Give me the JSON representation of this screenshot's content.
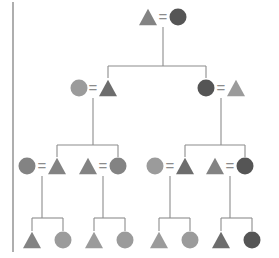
{
  "figure": {
    "kind": "pedigree-chart",
    "width": 279,
    "height": 258,
    "background": "#ffffff",
    "left_border": {
      "x": 13,
      "y_top": 2,
      "y_bottom": 252,
      "color": "#9a9a9a",
      "width": 1.6
    },
    "line_color": "#8c8c8c",
    "line_width": 1.1,
    "mating_symbol": "=",
    "mating_symbol_color": "#8c8c8c",
    "palette": {
      "light_gray": "#9b9b9b",
      "mid_gray": "#838383",
      "dark_gray": "#6d6d6d",
      "darkest_gray": "#555555"
    },
    "generations": [
      {
        "label": "I",
        "y": 17
      },
      {
        "label": "II",
        "y": 88
      },
      {
        "label": "III",
        "y": 166
      },
      {
        "label": "IV",
        "y": 240
      }
    ]
  },
  "chart_data": {
    "type": "pedigree",
    "title": "",
    "generation_count": 4,
    "individual_count": 22,
    "shapes": {
      "triangle": "male",
      "circle": "female"
    },
    "individuals": [
      {
        "id": "I-1",
        "gen": 1,
        "shape": "triangle",
        "color": "#838383",
        "cx": 148,
        "cy": 17,
        "size": 18
      },
      {
        "id": "I-2",
        "gen": 1,
        "shape": "circle",
        "color": "#555555",
        "cx": 178,
        "cy": 17,
        "size": 17
      },
      {
        "id": "II-1",
        "gen": 2,
        "shape": "circle",
        "color": "#9b9b9b",
        "cx": 79,
        "cy": 88,
        "size": 17
      },
      {
        "id": "II-2",
        "gen": 2,
        "shape": "triangle",
        "color": "#6d6d6d",
        "cx": 108,
        "cy": 88,
        "size": 18
      },
      {
        "id": "II-3",
        "gen": 2,
        "shape": "circle",
        "color": "#555555",
        "cx": 206,
        "cy": 88,
        "size": 17
      },
      {
        "id": "II-4",
        "gen": 2,
        "shape": "triangle",
        "color": "#9b9b9b",
        "cx": 236,
        "cy": 88,
        "size": 18
      },
      {
        "id": "III-1",
        "gen": 3,
        "shape": "circle",
        "color": "#838383",
        "cx": 27,
        "cy": 166,
        "size": 17
      },
      {
        "id": "III-2",
        "gen": 3,
        "shape": "triangle",
        "color": "#838383",
        "cx": 57,
        "cy": 166,
        "size": 18
      },
      {
        "id": "III-3",
        "gen": 3,
        "shape": "triangle",
        "color": "#838383",
        "cx": 88,
        "cy": 166,
        "size": 18
      },
      {
        "id": "III-4",
        "gen": 3,
        "shape": "circle",
        "color": "#838383",
        "cx": 118,
        "cy": 166,
        "size": 17
      },
      {
        "id": "III-5",
        "gen": 3,
        "shape": "circle",
        "color": "#9b9b9b",
        "cx": 155,
        "cy": 166,
        "size": 17
      },
      {
        "id": "III-6",
        "gen": 3,
        "shape": "triangle",
        "color": "#6d6d6d",
        "cx": 185,
        "cy": 166,
        "size": 18
      },
      {
        "id": "III-7",
        "gen": 3,
        "shape": "triangle",
        "color": "#838383",
        "cx": 215,
        "cy": 166,
        "size": 18
      },
      {
        "id": "III-8",
        "gen": 3,
        "shape": "circle",
        "color": "#555555",
        "cx": 245,
        "cy": 166,
        "size": 17
      },
      {
        "id": "IV-1",
        "gen": 4,
        "shape": "triangle",
        "color": "#838383",
        "cx": 32,
        "cy": 240,
        "size": 18
      },
      {
        "id": "IV-2",
        "gen": 4,
        "shape": "circle",
        "color": "#9b9b9b",
        "cx": 63,
        "cy": 240,
        "size": 17
      },
      {
        "id": "IV-3",
        "gen": 4,
        "shape": "triangle",
        "color": "#9b9b9b",
        "cx": 94,
        "cy": 240,
        "size": 18
      },
      {
        "id": "IV-4",
        "gen": 4,
        "shape": "circle",
        "color": "#9b9b9b",
        "cx": 125,
        "cy": 240,
        "size": 17
      },
      {
        "id": "IV-5",
        "gen": 4,
        "shape": "triangle",
        "color": "#9b9b9b",
        "cx": 159,
        "cy": 240,
        "size": 18
      },
      {
        "id": "IV-6",
        "gen": 4,
        "shape": "circle",
        "color": "#9b9b9b",
        "cx": 190,
        "cy": 240,
        "size": 17
      },
      {
        "id": "IV-7",
        "gen": 4,
        "shape": "triangle",
        "color": "#6d6d6d",
        "cx": 221,
        "cy": 240,
        "size": 18
      },
      {
        "id": "IV-8",
        "gen": 4,
        "shape": "circle",
        "color": "#555555",
        "cx": 252,
        "cy": 240,
        "size": 17
      }
    ],
    "matings": [
      {
        "id": "M1",
        "partners": [
          "I-1",
          "I-2"
        ],
        "symbol_x": 163,
        "symbol_y": 17,
        "drop_x": 163
      },
      {
        "id": "M2",
        "partners": [
          "II-1",
          "II-2"
        ],
        "symbol_x": 93,
        "symbol_y": 88,
        "drop_x": 93
      },
      {
        "id": "M3",
        "partners": [
          "II-3",
          "II-4"
        ],
        "symbol_x": 221,
        "symbol_y": 88,
        "drop_x": 221
      },
      {
        "id": "M4",
        "partners": [
          "III-1",
          "III-2"
        ],
        "symbol_x": 42,
        "symbol_y": 166,
        "drop_x": 42
      },
      {
        "id": "M5",
        "partners": [
          "III-3",
          "III-4"
        ],
        "symbol_x": 103,
        "symbol_y": 166,
        "drop_x": 103
      },
      {
        "id": "M6",
        "partners": [
          "III-5",
          "III-6"
        ],
        "symbol_x": 170,
        "symbol_y": 166,
        "drop_x": 170
      },
      {
        "id": "M7",
        "partners": [
          "III-7",
          "III-8"
        ],
        "symbol_x": 230,
        "symbol_y": 166,
        "drop_x": 230
      }
    ],
    "sibships": [
      {
        "id": "S1",
        "mating": "M1",
        "drop_x": 163,
        "drop_y0": 27,
        "bar_y": 66,
        "bar_x0": 108,
        "bar_x1": 206,
        "children": [
          "II-2",
          "II-3"
        ],
        "child_tops": 78
      },
      {
        "id": "S2",
        "mating": "M2",
        "drop_x": 93,
        "drop_y0": 98,
        "bar_y": 145,
        "bar_x0": 57,
        "bar_x1": 118,
        "children": [
          "III-2",
          "III-4"
        ],
        "child_tops": 157
      },
      {
        "id": "S3",
        "mating": "M3",
        "drop_x": 221,
        "drop_y0": 98,
        "bar_y": 145,
        "bar_x0": 185,
        "bar_x1": 245,
        "children": [
          "III-6",
          "III-8"
        ],
        "child_tops": 157
      },
      {
        "id": "S4",
        "mating": "M4",
        "drop_x": 42,
        "drop_y0": 176,
        "bar_y": 218,
        "bar_x0": 32,
        "bar_x1": 63,
        "children": [
          "IV-1",
          "IV-2"
        ],
        "child_tops": 231
      },
      {
        "id": "S5",
        "mating": "M5",
        "drop_x": 103,
        "drop_y0": 176,
        "bar_y": 218,
        "bar_x0": 94,
        "bar_x1": 125,
        "children": [
          "IV-3",
          "IV-4"
        ],
        "child_tops": 231
      },
      {
        "id": "S6",
        "mating": "M6",
        "drop_x": 170,
        "drop_y0": 176,
        "bar_y": 218,
        "bar_x0": 159,
        "bar_x1": 190,
        "children": [
          "IV-5",
          "IV-6"
        ],
        "child_tops": 231
      },
      {
        "id": "S7",
        "mating": "M7",
        "drop_x": 230,
        "drop_y0": 176,
        "bar_y": 218,
        "bar_x0": 221,
        "bar_x1": 252,
        "children": [
          "IV-7",
          "IV-8"
        ],
        "child_tops": 231
      }
    ]
  }
}
